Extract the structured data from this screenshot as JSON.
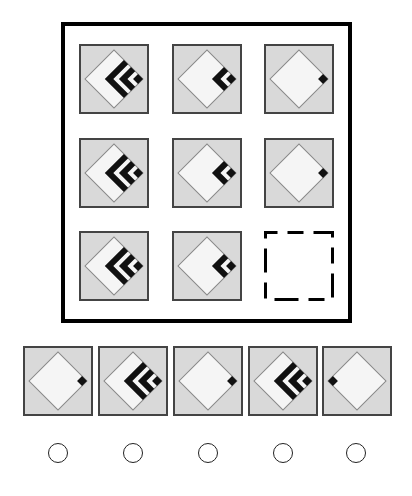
{
  "puzzle": {
    "type": "matrix-reasoning",
    "grid_rows": 3,
    "grid_cols": 3,
    "colors": {
      "frame": "#000000",
      "tile_bg": "#d9d9d9",
      "tile_border": "#444444",
      "diamond_fill": "#f5f5f5",
      "diamond_outline": "#888888",
      "mark": "#111111"
    },
    "cells": [
      {
        "row": 1,
        "col": 1,
        "corner_square": "right",
        "bands": 2
      },
      {
        "row": 1,
        "col": 2,
        "corner_square": "right",
        "bands": 1
      },
      {
        "row": 1,
        "col": 3,
        "corner_square": "right",
        "bands": 0
      },
      {
        "row": 2,
        "col": 1,
        "corner_square": "right",
        "bands": 2
      },
      {
        "row": 2,
        "col": 2,
        "corner_square": "right",
        "bands": 1
      },
      {
        "row": 2,
        "col": 3,
        "corner_square": "right",
        "bands": 0
      },
      {
        "row": 3,
        "col": 1,
        "corner_square": "right",
        "bands": 2
      },
      {
        "row": 3,
        "col": 2,
        "corner_square": "right",
        "bands": 1
      },
      {
        "row": 3,
        "col": 3,
        "missing": true
      }
    ],
    "options": [
      {
        "index": 1,
        "corner_square": "right",
        "bands": 0
      },
      {
        "index": 2,
        "corner_square": "right",
        "bands": 2
      },
      {
        "index": 3,
        "corner_square": "right",
        "bands": 0
      },
      {
        "index": 4,
        "corner_square": "right",
        "bands": 2
      },
      {
        "index": 5,
        "corner_square": "left",
        "bands": 0
      }
    ]
  }
}
